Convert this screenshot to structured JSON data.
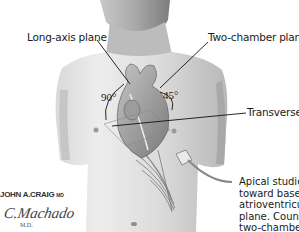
{
  "figure": {
    "labels": {
      "long_axis": "Long-axis plane",
      "two_chamber": "Two-chamber plane",
      "transverse": "Transverse"
    },
    "angles": {
      "left": "90°",
      "right": "45°"
    },
    "caption_lines": [
      "Apical studies",
      "toward base.",
      "atrioventricul",
      "plane. Counte",
      "two-chamber"
    ],
    "signatures": {
      "artist": "JOHN A.CRAIG",
      "artist_suffix": "MD",
      "second": "C.Machado",
      "second_suffix": "M.D."
    },
    "colors": {
      "skin_light": "#e6e6e6",
      "skin_mid": "#bdbdbd",
      "skin_dark": "#8a8a8a",
      "line": "#111111",
      "background": "#ffffff"
    }
  }
}
